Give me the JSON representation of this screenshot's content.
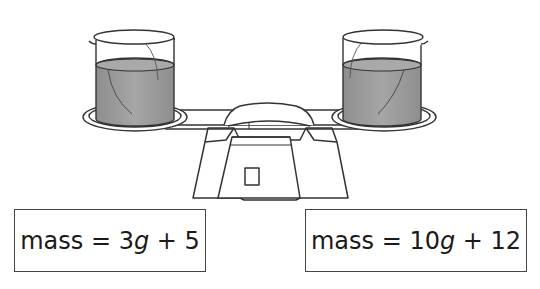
{
  "diagram": {
    "type": "balance-scale",
    "colors": {
      "stroke": "#333333",
      "liquid": "#9a9a9a",
      "background": "#ffffff"
    },
    "left_pan": {
      "object": "beaker",
      "contents": "liquid"
    },
    "right_pan": {
      "object": "beaker",
      "contents": "liquid"
    }
  },
  "equations": {
    "left": {
      "prefix": "mass = ",
      "coef": "3",
      "var": "g",
      "suffix": " + 5"
    },
    "right": {
      "prefix": "mass = ",
      "coef": "10",
      "var": "g",
      "suffix": " + 12"
    }
  }
}
